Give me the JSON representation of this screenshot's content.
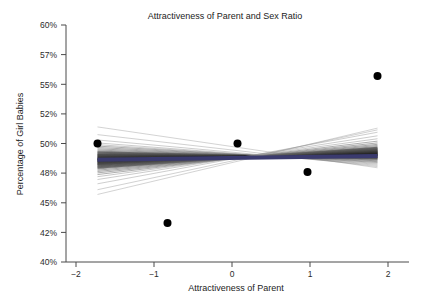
{
  "chart_data": {
    "type": "scatter",
    "title": "Attractiveness of Parent and Sex Ratio",
    "xlabel": "Attractiveness of Parent",
    "ylabel": "Percentage of Girl Babies",
    "xlim": [
      -2.45,
      2.45
    ],
    "ylim": [
      40,
      60
    ],
    "grid": false,
    "legend": null,
    "xticks": [
      -2,
      -1,
      0,
      1,
      2
    ],
    "xticklabels": [
      "−2",
      "−1",
      "0",
      "1",
      "2"
    ],
    "yticks": [
      40,
      42.5,
      45,
      47.5,
      50,
      52.5,
      55,
      57.5,
      60
    ],
    "yticklabels": [
      "40%",
      "42%",
      "45%",
      "48%",
      "50%",
      "52%",
      "55%",
      "57%",
      "60%"
    ],
    "series": [
      {
        "name": "Observed sex ratio by attractiveness category",
        "type": "scatter",
        "marker": "filled-circle",
        "color": "#000000",
        "x": [
          -2,
          -1,
          0,
          1,
          2
        ],
        "y": [
          50.0,
          43.3,
          50.0,
          47.6,
          55.7
        ]
      },
      {
        "name": "Bootstrap / simulated regression lines",
        "type": "line-bundle",
        "color": "#555555",
        "count": 41,
        "description": "Dense fan of thin grey-black straight fits pivoting near x = 0.4, y = 48.8",
        "pivot": [
          0.4,
          48.8
        ],
        "endpoints_left_x": -2,
        "endpoints_right_x": 2,
        "endpoints_left_y_range": [
          45.7,
          51.4
        ],
        "endpoints_right_y_range": [
          47.8,
          51.3
        ],
        "left_y": [
          51.4,
          50.75,
          50.3,
          50.05,
          49.9,
          49.78,
          49.66,
          49.55,
          49.45,
          49.36,
          49.28,
          49.2,
          49.12,
          49.05,
          48.98,
          48.92,
          48.86,
          48.8,
          48.74,
          48.68,
          48.62,
          48.56,
          48.5,
          48.44,
          48.38,
          48.32,
          48.25,
          48.18,
          48.1,
          48.02,
          47.94,
          47.85,
          47.75,
          47.64,
          47.52,
          47.38,
          47.2,
          46.96,
          46.6,
          46.1,
          45.7
        ],
        "right_y": [
          47.95,
          48.05,
          48.15,
          48.24,
          48.32,
          48.4,
          48.47,
          48.54,
          48.6,
          48.66,
          48.72,
          48.77,
          48.82,
          48.87,
          48.92,
          48.96,
          49.0,
          49.04,
          49.08,
          49.12,
          49.16,
          49.2,
          49.24,
          49.28,
          49.32,
          49.37,
          49.42,
          49.47,
          49.53,
          49.59,
          49.66,
          49.74,
          49.83,
          49.93,
          50.05,
          50.2,
          50.4,
          50.65,
          50.95,
          51.15,
          51.3
        ]
      },
      {
        "name": "Mean fitted line",
        "type": "line",
        "color": "#3a3a6e",
        "width": 4,
        "x": [
          -2,
          2
        ],
        "y": [
          48.62,
          48.95
        ]
      }
    ],
    "annotations": []
  },
  "colors": {
    "background": "#ffffff",
    "axis": "#4a4a4a",
    "text": "#1c1c1c",
    "point": "#000000",
    "mean_line": "#3a3a6e",
    "fan_line": "#555555"
  }
}
